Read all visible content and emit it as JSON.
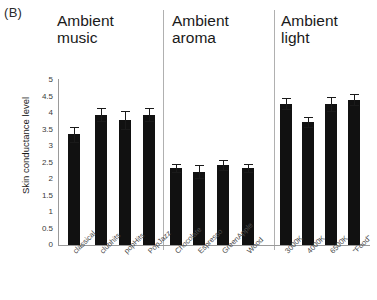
{
  "figure": {
    "panel_label": "(B)",
    "y_axis_title": "Skin conductance level",
    "y_ticks": [
      "5",
      "4.5",
      "4",
      "3.5",
      "3",
      "2.5",
      "2",
      "1.5",
      "1",
      "0.5",
      "0"
    ]
  },
  "groups": [
    {
      "title": "Ambient\nmusic"
    },
    {
      "title": "Ambient\naroma"
    },
    {
      "title": "Ambient\nlight"
    }
  ],
  "chart_data": {
    "type": "bar",
    "title": "",
    "subtitle": "",
    "xlabel": "",
    "ylabel": "Skin conductance level",
    "ylim": [
      0,
      5
    ],
    "ytick_step": 0.5,
    "grid": false,
    "legend": "none",
    "panel_label": "(B)",
    "panels": [
      {
        "name": "Ambient music",
        "categories": [
          "classical",
          "clubhits",
          "popHits",
          "PopJazz"
        ],
        "values": [
          3.35,
          3.95,
          3.78,
          3.95
        ],
        "errors": [
          0.22,
          0.2,
          0.27,
          0.2
        ]
      },
      {
        "name": "Ambient aroma",
        "categories": [
          "Chocolate",
          "Espresso",
          "GreenApple",
          "Wood"
        ],
        "values": [
          2.33,
          2.22,
          2.42,
          2.32
        ],
        "errors": [
          0.12,
          0.2,
          0.15,
          0.12
        ]
      },
      {
        "name": "Ambient light",
        "categories": [
          "3000K",
          "4000K",
          "6500K",
          "\"Food\""
        ],
        "values": [
          4.28,
          3.72,
          4.27,
          4.4
        ],
        "errors": [
          0.16,
          0.15,
          0.2,
          0.17
        ]
      }
    ]
  },
  "colors": {
    "bar": "#111111",
    "axis": "#9a9a9a",
    "divider": "#b0b0b0",
    "text": "#1a1a1a"
  }
}
